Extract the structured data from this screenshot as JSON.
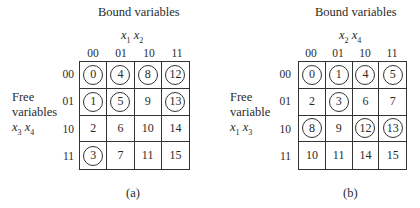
{
  "diagrams": [
    {
      "id": "a",
      "caption": "(a)",
      "bound_title": "Bound variables",
      "bound_vars": {
        "v1": "x",
        "s1": "1",
        "v2": "x",
        "s2": "2"
      },
      "free_label": {
        "line1": "Free",
        "line2": "variables",
        "v1": "x",
        "s1": "3",
        "v2": "x",
        "s2": "4"
      },
      "col_headers": [
        "00",
        "01",
        "10",
        "11"
      ],
      "row_headers": [
        "00",
        "01",
        "10",
        "11"
      ],
      "cells": [
        [
          {
            "v": "0",
            "c": true
          },
          {
            "v": "4",
            "c": true
          },
          {
            "v": "8",
            "c": true
          },
          {
            "v": "12",
            "c": true
          }
        ],
        [
          {
            "v": "1",
            "c": true
          },
          {
            "v": "5",
            "c": true
          },
          {
            "v": "9",
            "c": false
          },
          {
            "v": "13",
            "c": true
          }
        ],
        [
          {
            "v": "2",
            "c": false
          },
          {
            "v": "6",
            "c": false
          },
          {
            "v": "10",
            "c": false
          },
          {
            "v": "14",
            "c": false
          }
        ],
        [
          {
            "v": "3",
            "c": true
          },
          {
            "v": "7",
            "c": false
          },
          {
            "v": "11",
            "c": false
          },
          {
            "v": "15",
            "c": false
          }
        ]
      ]
    },
    {
      "id": "b",
      "caption": "(b)",
      "bound_title": "Bound variables",
      "bound_vars": {
        "v1": "x",
        "s1": "2",
        "v2": "x",
        "s2": "4"
      },
      "free_label": {
        "line1": "Free",
        "line2": "variable",
        "v1": "x",
        "s1": "1",
        "v2": "x",
        "s2": "3"
      },
      "col_headers": [
        "00",
        "01",
        "10",
        "11"
      ],
      "row_headers": [
        "00",
        "01",
        "10",
        "11"
      ],
      "cells": [
        [
          {
            "v": "0",
            "c": true
          },
          {
            "v": "1",
            "c": true
          },
          {
            "v": "4",
            "c": true
          },
          {
            "v": "5",
            "c": true
          }
        ],
        [
          {
            "v": "2",
            "c": false
          },
          {
            "v": "3",
            "c": true
          },
          {
            "v": "6",
            "c": false
          },
          {
            "v": "7",
            "c": false
          }
        ],
        [
          {
            "v": "8",
            "c": true
          },
          {
            "v": "9",
            "c": false
          },
          {
            "v": "12",
            "c": true
          },
          {
            "v": "13",
            "c": true
          }
        ],
        [
          {
            "v": "10",
            "c": false
          },
          {
            "v": "11",
            "c": false
          },
          {
            "v": "14",
            "c": false
          },
          {
            "v": "15",
            "c": false
          }
        ]
      ]
    }
  ]
}
